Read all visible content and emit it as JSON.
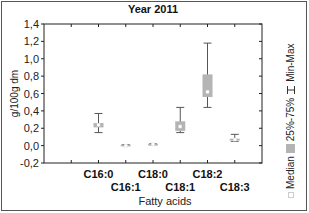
{
  "chart_data": {
    "type": "box",
    "title": "Year 2011",
    "xlabel": "Fatty acids",
    "ylabel": "g/100g dm",
    "ylim": [
      -0.2,
      1.4
    ],
    "yticks": [
      "-0,2",
      "0,0",
      "0,2",
      "0,4",
      "0,6",
      "0,8",
      "1,0",
      "1,2",
      "1,4"
    ],
    "grid": false,
    "legend_position": "right (rotated)",
    "categories": [
      "C16:0",
      "C16:1",
      "C18:0",
      "C18:1",
      "C18:2",
      "C18:3"
    ],
    "series": [
      {
        "name": "Min",
        "values": [
          0.15,
          0.0,
          0.01,
          0.15,
          0.44,
          0.05
        ]
      },
      {
        "name": "25%",
        "values": [
          0.21,
          0.0,
          0.01,
          0.17,
          0.56,
          0.06
        ]
      },
      {
        "name": "Median",
        "values": [
          0.24,
          0.0,
          0.015,
          0.22,
          0.62,
          0.07
        ]
      },
      {
        "name": "75%",
        "values": [
          0.26,
          0.01,
          0.02,
          0.28,
          0.82,
          0.08
        ]
      },
      {
        "name": "Max",
        "values": [
          0.37,
          0.01,
          0.02,
          0.44,
          1.18,
          0.13
        ]
      }
    ]
  },
  "legend": {
    "median": "Median",
    "box": "25%-75%",
    "whisker": "Min-Max"
  },
  "colors": {
    "box_fill": "#b4b4b4",
    "whisker": "#555555",
    "axis": "#222222"
  }
}
